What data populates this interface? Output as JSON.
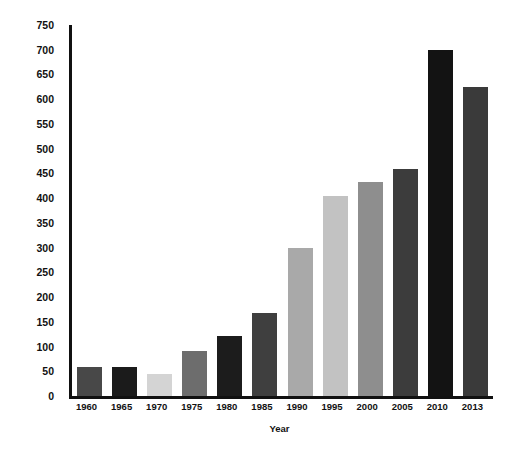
{
  "chart_data": {
    "type": "bar",
    "title": "",
    "xlabel": "Year",
    "ylabel": "Thousands of Commitments",
    "categories": [
      "1960",
      "1965",
      "1970",
      "1975",
      "1980",
      "1985",
      "1990",
      "1995",
      "2000",
      "2005",
      "2010",
      "2013"
    ],
    "values": [
      58,
      58,
      45,
      90,
      122,
      168,
      300,
      405,
      432,
      458,
      700,
      625
    ],
    "bar_colors": [
      "#484848",
      "#1b1b1b",
      "#d4d4d4",
      "#6d6d6d",
      "#1c1c1c",
      "#3f3f3f",
      "#a9a9a9",
      "#c2c2c2",
      "#8e8e8e",
      "#3c3c3c",
      "#131313",
      "#3a3a3a"
    ],
    "ylim": [
      0,
      750
    ],
    "yticks": [
      0,
      50,
      100,
      150,
      200,
      250,
      300,
      350,
      400,
      450,
      500,
      550,
      600,
      650,
      700,
      750
    ],
    "ytick_labels": [
      "0",
      "50",
      "100",
      "150",
      "200",
      "250",
      "300",
      "350",
      "400",
      "450",
      "500",
      "550",
      "600",
      "650",
      "700",
      "750"
    ],
    "grid": false,
    "legend": "none",
    "axis_color": "#111111",
    "background": "#ffffff"
  }
}
